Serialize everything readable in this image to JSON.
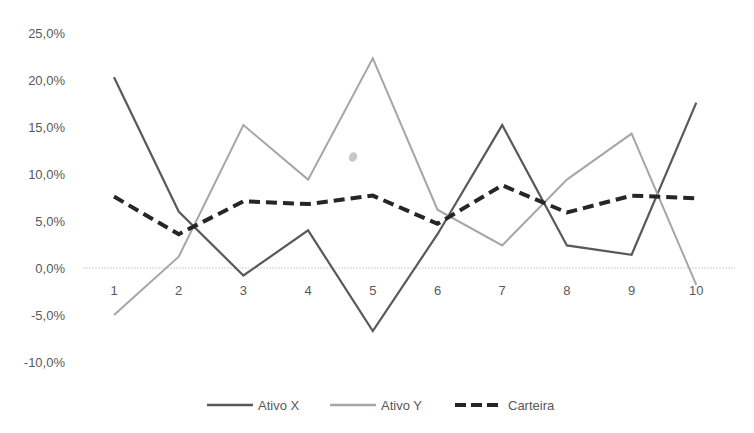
{
  "chart_data": {
    "type": "line",
    "title": "",
    "xlabel": "",
    "ylabel": "",
    "categories": [
      "1",
      "2",
      "3",
      "4",
      "5",
      "6",
      "7",
      "8",
      "9",
      "10"
    ],
    "y_ticks": [
      "25,0%",
      "20,0%",
      "15,0%",
      "10,0%",
      "5,0%",
      "0,0%",
      "-5,0%",
      "-10,0%"
    ],
    "y_tick_values": [
      25,
      20,
      15,
      10,
      5,
      0,
      -5,
      -10
    ],
    "ylim": [
      -10,
      25
    ],
    "grid": false,
    "zero_line": true,
    "legend_position": "bottom",
    "series": [
      {
        "name": "Ativo X",
        "color": "#595959",
        "style": "solid",
        "width": 2.2,
        "values": [
          20.3,
          6.0,
          -0.8,
          4.0,
          -6.7,
          3.6,
          15.2,
          2.4,
          1.4,
          17.6
        ]
      },
      {
        "name": "Ativo Y",
        "color": "#a6a6a6",
        "style": "solid",
        "width": 2,
        "values": [
          -5.0,
          1.2,
          15.2,
          9.4,
          22.3,
          6.2,
          2.4,
          9.4,
          14.3,
          -1.8
        ]
      },
      {
        "name": "Carteira",
        "color": "#262626",
        "style": "dashed",
        "width": 4,
        "values": [
          7.6,
          3.6,
          7.1,
          6.8,
          7.7,
          4.7,
          8.8,
          5.9,
          7.7,
          7.4
        ]
      }
    ]
  }
}
